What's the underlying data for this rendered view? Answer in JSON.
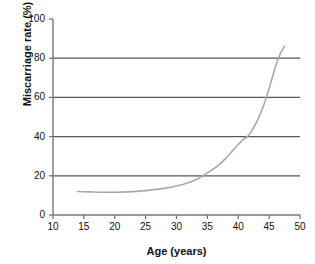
{
  "chart_data": {
    "type": "line",
    "title": "",
    "xlabel": "Age (years)",
    "ylabel": "Miscarriage rate (%)",
    "xlim": [
      10,
      50
    ],
    "ylim": [
      0,
      100
    ],
    "xticks": [
      10,
      15,
      20,
      25,
      30,
      35,
      40,
      45,
      50
    ],
    "yticks": [
      0,
      20,
      40,
      60,
      80,
      100
    ],
    "xtick_labels": [
      "10",
      "15",
      "20",
      "25",
      "30",
      "35",
      "40",
      "45",
      "50"
    ],
    "ytick_labels": [
      "0",
      "20",
      "40",
      "60",
      "80",
      "100"
    ],
    "grid": {
      "horizontal": true,
      "vertical": false,
      "at_values": [
        20,
        40,
        60,
        80
      ],
      "color": "#595959"
    },
    "legend": null,
    "annotations": [],
    "series": [
      {
        "name": "Miscarriage rate",
        "color": "#a8a8a8",
        "line_width": 1.6,
        "x": [
          14,
          16,
          18,
          20,
          22,
          24,
          26,
          28,
          30,
          32,
          33.5,
          35,
          36,
          37,
          38,
          39,
          40,
          41,
          41.5,
          42,
          43,
          44,
          44.5,
          45,
          45.5,
          46,
          46.5,
          47,
          47.5
        ],
        "y": [
          12.0,
          11.8,
          11.6,
          11.6,
          11.8,
          12.2,
          12.8,
          13.6,
          14.8,
          16.6,
          18.5,
          21.5,
          23.5,
          26.0,
          29.0,
          32.5,
          36.0,
          39.0,
          40.0,
          42.0,
          47.5,
          55.0,
          59.5,
          64.5,
          70.0,
          75.5,
          80.0,
          83.5,
          86.0
        ]
      }
    ]
  },
  "axes": {
    "axis_color": "#777777",
    "tick_color": "#777777"
  }
}
